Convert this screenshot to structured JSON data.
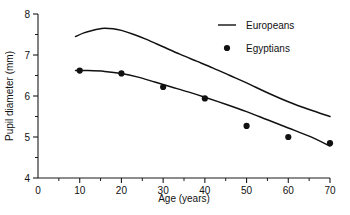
{
  "chart_data": {
    "type": "line",
    "title": "",
    "subtitle": "",
    "xlabel": "Age (years)",
    "ylabel": "Pupil diameter (mm)",
    "xlim": [
      0,
      70
    ],
    "ylim": [
      4,
      8
    ],
    "xticks": [
      0,
      10,
      20,
      30,
      40,
      50,
      60,
      70
    ],
    "xtick_labels": [
      "0",
      "10",
      "20",
      "30",
      "40",
      "50",
      "60",
      "70"
    ],
    "xminor_ticks": [
      5,
      15,
      25,
      35,
      45,
      55,
      65
    ],
    "yticks": [
      4,
      5,
      6,
      7,
      8
    ],
    "ytick_labels": [
      "4",
      "5",
      "6",
      "7",
      "8"
    ],
    "yminor_ticks": [
      4.5,
      5.5,
      6.5,
      7.5
    ],
    "grid": false,
    "legend_position": "top-right",
    "series": [
      {
        "name": "Europeans",
        "marker": "none",
        "style": "line",
        "color": "#111111",
        "x": [
          9,
          11,
          13,
          15,
          16,
          18,
          20,
          23,
          26,
          30,
          34,
          38,
          42,
          46,
          50,
          55,
          60,
          65,
          70
        ],
        "values": [
          7.45,
          7.54,
          7.6,
          7.64,
          7.65,
          7.64,
          7.6,
          7.5,
          7.38,
          7.2,
          7.02,
          6.85,
          6.68,
          6.5,
          6.32,
          6.08,
          5.86,
          5.67,
          5.5
        ]
      },
      {
        "name": "Egyptians",
        "marker": "filled-circle",
        "style": "line+markers",
        "color": "#111111",
        "x": [
          9,
          12,
          16,
          20,
          24,
          28,
          32,
          36,
          40,
          45,
          50,
          55,
          60,
          65,
          70
        ],
        "values": [
          6.62,
          6.62,
          6.6,
          6.55,
          6.46,
          6.34,
          6.22,
          6.1,
          5.97,
          5.8,
          5.62,
          5.42,
          5.22,
          5.02,
          4.78
        ],
        "points": [
          {
            "x": 10,
            "y": 6.62
          },
          {
            "x": 20,
            "y": 6.55
          },
          {
            "x": 30,
            "y": 6.22
          },
          {
            "x": 40,
            "y": 5.94
          },
          {
            "x": 50,
            "y": 5.27
          },
          {
            "x": 60,
            "y": 5.0
          },
          {
            "x": 70,
            "y": 4.85
          }
        ]
      }
    ],
    "legend": [
      {
        "label": "Europeans",
        "marker": "line"
      },
      {
        "label": "Egyptians",
        "marker": "filled-circle"
      }
    ]
  }
}
